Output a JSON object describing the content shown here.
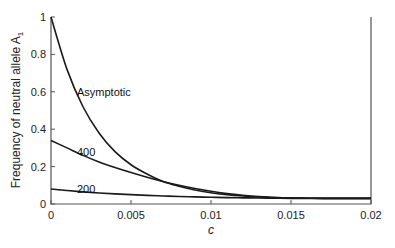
{
  "chart_data": {
    "type": "line",
    "title": "",
    "xlabel": "c",
    "ylabel": "Frequency of neutral allele A1",
    "ylabel_main": "Frequency of neutral allele A",
    "ylabel_sub": "1",
    "xlim": [
      0,
      0.02
    ],
    "ylim": [
      0,
      1
    ],
    "grid": false,
    "legend": "inline labels",
    "x_ticks": [
      0,
      0.005,
      0.01,
      0.015,
      0.02
    ],
    "x_tick_labels": [
      "0",
      "0.005",
      "0.01",
      "0.015",
      "0.02"
    ],
    "y_ticks": [
      0,
      0.2,
      0.4,
      0.6,
      0.8,
      1
    ],
    "y_tick_labels": [
      "0",
      "0.2",
      "0.4",
      "0.6",
      "0.8",
      "1"
    ],
    "x": [
      0,
      0.001,
      0.002,
      0.003,
      0.004,
      0.005,
      0.006,
      0.007,
      0.008,
      0.009,
      0.01,
      0.011,
      0.012,
      0.013,
      0.014,
      0.015,
      0.016,
      0.017,
      0.018,
      0.019,
      0.02
    ],
    "series": [
      {
        "name": "Asymptotic",
        "label_pos": [
          0.0015,
          0.6
        ],
        "values": [
          1.0,
          0.72,
          0.52,
          0.38,
          0.28,
          0.21,
          0.16,
          0.12,
          0.095,
          0.075,
          0.06,
          0.05,
          0.043,
          0.038,
          0.034,
          0.032,
          0.031,
          0.03,
          0.03,
          0.03,
          0.03
        ]
      },
      {
        "name": "400",
        "label_pos": [
          0.0015,
          0.28
        ],
        "values": [
          0.34,
          0.3,
          0.26,
          0.225,
          0.195,
          0.168,
          0.143,
          0.12,
          0.1,
          0.083,
          0.068,
          0.056,
          0.047,
          0.04,
          0.035,
          0.032,
          0.031,
          0.03,
          0.03,
          0.03,
          0.03
        ]
      },
      {
        "name": "200",
        "label_pos": [
          0.0015,
          0.08
        ],
        "values": [
          0.08,
          0.072,
          0.065,
          0.059,
          0.054,
          0.05,
          0.046,
          0.043,
          0.04,
          0.038,
          0.036,
          0.034,
          0.033,
          0.032,
          0.031,
          0.03,
          0.03,
          0.03,
          0.03,
          0.03,
          0.03
        ]
      }
    ]
  }
}
